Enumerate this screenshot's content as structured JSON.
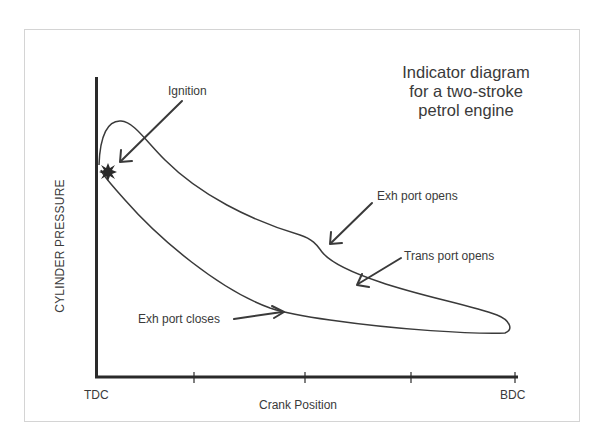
{
  "title": {
    "lines": [
      "Indicator diagram",
      "for a two-stroke",
      "petrol engine"
    ]
  },
  "axes": {
    "y_label": "CYLINDER PRESSURE",
    "x_label": "Crank Position",
    "x_ticks": {
      "start": "TDC",
      "end": "BDC"
    }
  },
  "annotations": {
    "ignition": "Ignition",
    "exh_port_opens": "Exh port opens",
    "trans_port_opens": "Trans port opens",
    "exh_port_closes": "Exh port closes"
  },
  "colors": {
    "line": "#3a3a3a",
    "axis": "#2a2a2a",
    "text": "#3a3a3a",
    "frame": "#d4d4d4"
  }
}
